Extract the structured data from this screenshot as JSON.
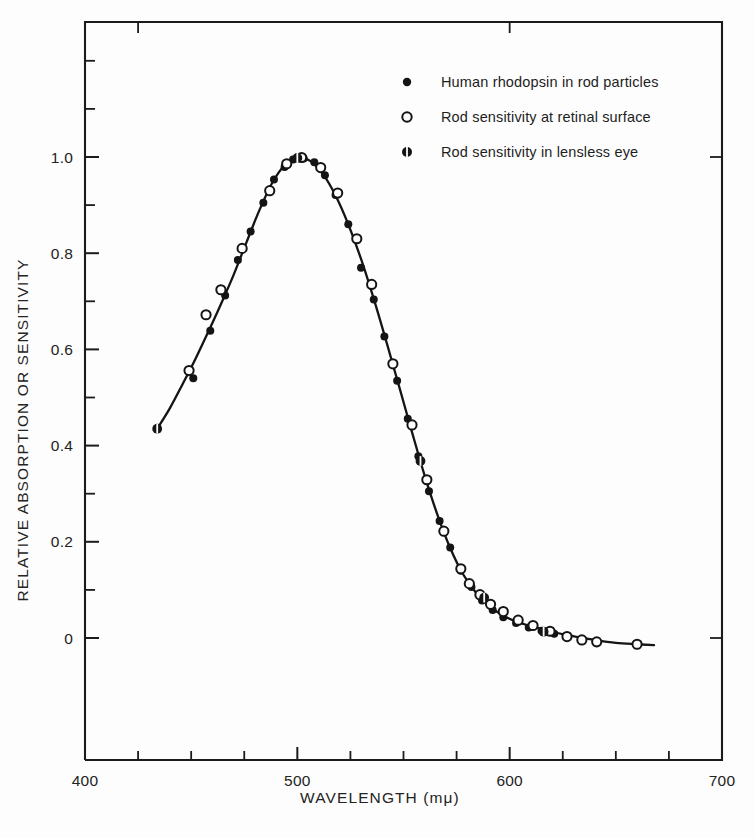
{
  "figure": {
    "background": "#fdfdfd",
    "ink": "#141414"
  },
  "axes": {
    "x": {
      "label": "WAVELENGTH (mμ)",
      "min": 400,
      "max": 700,
      "major_ticks": [
        400,
        500,
        600,
        700
      ],
      "major_tick_labels": [
        "400",
        "500",
        "600",
        "700"
      ],
      "minor_tick_step": 25,
      "grid": false
    },
    "y": {
      "label": "RELATIVE ABSORPTION OR SENSITIVITY",
      "min": -0.08,
      "max": 1.24,
      "major_ticks": [
        0,
        0.2,
        0.4,
        0.6,
        0.8,
        1.0
      ],
      "major_tick_labels": [
        "0",
        "0.2",
        "0.4",
        "0.6",
        "0.8",
        "1.0"
      ],
      "minor_ticks": [
        0.1,
        0.3,
        0.5,
        0.7,
        0.9,
        1.1
      ],
      "grid": false
    }
  },
  "legend": {
    "position": "top-right-inside",
    "entries": [
      {
        "marker": "filled-circle",
        "label": "Human rhodopsin in rod particles"
      },
      {
        "marker": "open-circle",
        "label": "Rod sensitivity at retinal surface"
      },
      {
        "marker": "banded-circle",
        "label": "Rod sensitivity in lensless eye"
      }
    ]
  },
  "chart_data": {
    "type": "scatter",
    "title": "",
    "subtitle": "",
    "xlabel": "WAVELENGTH (mμ)",
    "ylabel": "RELATIVE ABSORPTION OR SENSITIVITY",
    "xlim": [
      400,
      700
    ],
    "ylim": [
      -0.08,
      1.24
    ],
    "grid": false,
    "legend_position": "top-right-inside",
    "annotations": [],
    "fitted_curve": {
      "name": "Rhodopsin absorption spectrum (smooth fit)",
      "x": [
        434,
        440,
        446,
        452,
        458,
        464,
        470,
        476,
        482,
        488,
        494,
        500,
        506,
        512,
        518,
        524,
        530,
        536,
        542,
        548,
        554,
        560,
        566,
        572,
        578,
        584,
        590,
        596,
        602,
        608,
        614,
        620,
        626,
        632,
        640,
        650,
        660,
        668
      ],
      "y": [
        0.435,
        0.478,
        0.528,
        0.58,
        0.636,
        0.694,
        0.755,
        0.822,
        0.888,
        0.945,
        0.983,
        0.999,
        0.992,
        0.965,
        0.92,
        0.86,
        0.788,
        0.705,
        0.615,
        0.522,
        0.428,
        0.337,
        0.256,
        0.187,
        0.133,
        0.095,
        0.068,
        0.049,
        0.036,
        0.027,
        0.02,
        0.013,
        0.007,
        0.002,
        -0.004,
        -0.01,
        -0.013,
        -0.015
      ]
    },
    "series": [
      {
        "name": "Human rhodopsin in rod particles",
        "marker": "filled-circle",
        "points": [
          [
            451,
            0.54
          ],
          [
            459,
            0.639
          ],
          [
            466,
            0.712
          ],
          [
            472,
            0.786
          ],
          [
            478,
            0.845
          ],
          [
            484,
            0.905
          ],
          [
            489,
            0.953
          ],
          [
            494,
            0.979
          ],
          [
            498,
            0.995
          ],
          [
            503,
            0.997
          ],
          [
            508,
            0.989
          ],
          [
            513,
            0.962
          ],
          [
            518,
            0.921
          ],
          [
            524,
            0.86
          ],
          [
            530,
            0.77
          ],
          [
            536,
            0.704
          ],
          [
            541,
            0.627
          ],
          [
            547,
            0.535
          ],
          [
            552,
            0.456
          ],
          [
            557,
            0.378
          ],
          [
            562,
            0.305
          ],
          [
            567,
            0.243
          ],
          [
            572,
            0.188
          ],
          [
            577,
            0.14
          ],
          [
            582,
            0.106
          ],
          [
            587,
            0.078
          ],
          [
            592,
            0.058
          ],
          [
            597,
            0.043
          ],
          [
            603,
            0.031
          ],
          [
            609,
            0.022
          ],
          [
            615,
            0.015
          ],
          [
            621,
            0.009
          ],
          [
            627,
            0.004
          ]
        ]
      },
      {
        "name": "Rod sensitivity at retinal surface",
        "marker": "open-circle",
        "points": [
          [
            449,
            0.556
          ],
          [
            457,
            0.672
          ],
          [
            464,
            0.724
          ],
          [
            474,
            0.81
          ],
          [
            487,
            0.93
          ],
          [
            495,
            0.986
          ],
          [
            502,
            0.999
          ],
          [
            511,
            0.978
          ],
          [
            519,
            0.925
          ],
          [
            528,
            0.83
          ],
          [
            535,
            0.735
          ],
          [
            545,
            0.57
          ],
          [
            554,
            0.443
          ],
          [
            561,
            0.329
          ],
          [
            569,
            0.222
          ],
          [
            577,
            0.144
          ],
          [
            581,
            0.113
          ],
          [
            586,
            0.09
          ],
          [
            591,
            0.07
          ],
          [
            597,
            0.055
          ],
          [
            604,
            0.037
          ],
          [
            611,
            0.026
          ],
          [
            619,
            0.014
          ],
          [
            627,
            0.003
          ],
          [
            634,
            -0.004
          ],
          [
            641,
            -0.008
          ],
          [
            660,
            -0.013
          ]
        ]
      },
      {
        "name": "Rod sensitivity in lensless eye",
        "marker": "banded-circle",
        "points": [
          [
            434,
            0.435
          ],
          [
            500,
            0.998
          ],
          [
            558,
            0.368
          ],
          [
            588,
            0.084
          ],
          [
            616,
            0.013
          ]
        ]
      }
    ]
  }
}
